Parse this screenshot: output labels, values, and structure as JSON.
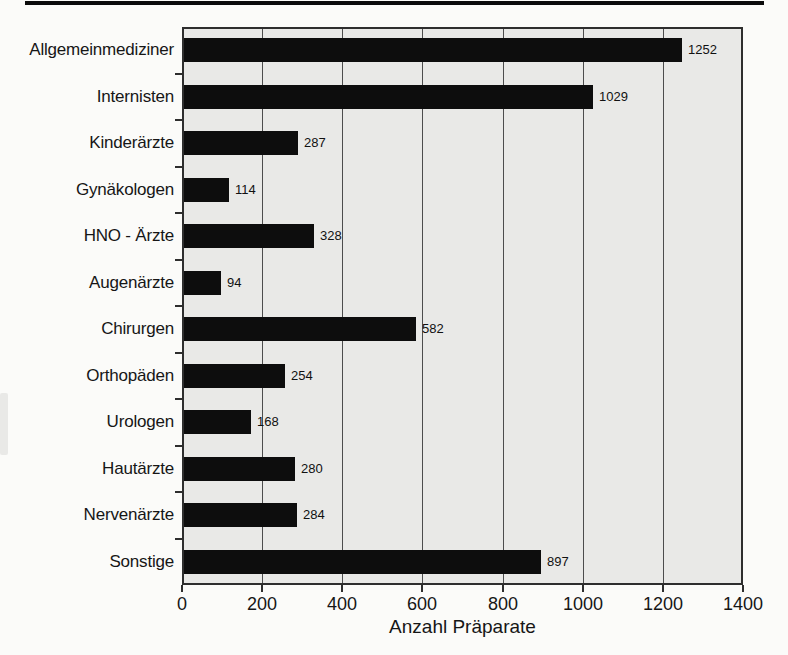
{
  "chart_data": {
    "type": "bar",
    "orientation": "horizontal",
    "title": "",
    "xlabel": "Anzahl Präparate",
    "ylabel": "",
    "categories": [
      "Allgemeinmediziner",
      "Internisten",
      "Kinderärzte",
      "Gynäkologen",
      "HNO - Ärzte",
      "Augenärzte",
      "Chirurgen",
      "Orthopäden",
      "Urologen",
      "Hautärzte",
      "Nervenärzte",
      "Sonstige"
    ],
    "values": [
      1252,
      1029,
      287,
      114,
      328,
      94,
      582,
      254,
      168,
      280,
      284,
      897
    ],
    "value_labels": [
      "1252",
      "1029",
      "287",
      "114",
      "328",
      "94",
      "582",
      "254",
      "168",
      "280",
      "284",
      "897"
    ],
    "xlim": [
      0,
      1400
    ],
    "xticks": [
      0,
      200,
      400,
      600,
      800,
      1000,
      1200,
      1400
    ],
    "grid": true,
    "legend": false,
    "bar_color": "#0d0d0d",
    "plot_background": "#e9e9e7",
    "grid_color": "#4d4d4d"
  }
}
